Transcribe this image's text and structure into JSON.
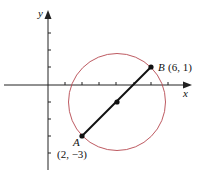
{
  "diagram": {
    "axes": {
      "x_label": "x",
      "y_label": "y"
    },
    "points": {
      "A": {
        "name": "A",
        "coords": "(2, −3)",
        "x": 2,
        "y": -3
      },
      "B": {
        "name": "B",
        "coords": "(6, 1)",
        "x": 6,
        "y": 1
      },
      "M": {
        "x": 4,
        "y": -1
      }
    },
    "circle": {
      "center": [
        4,
        -1
      ],
      "color": "#b5474f"
    },
    "segment_color": "#111111"
  }
}
